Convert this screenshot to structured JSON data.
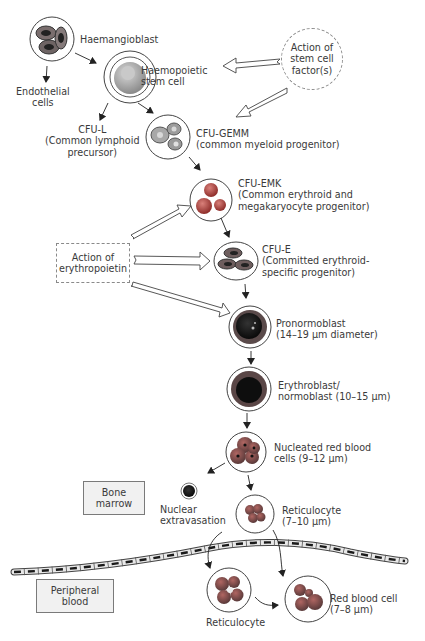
{
  "diagram": {
    "nodes": {
      "haemangioblast": {
        "label": "Haemangioblast"
      },
      "endothelial": {
        "label": "Endothelial\ncells"
      },
      "hsc": {
        "label": "Haemopoietic\nstem cell"
      },
      "cfu_l": {
        "label": "CFU-L\n(Common lymphoid\nprecursor)"
      },
      "cfu_gemm": {
        "label": "CFU-GEMM\n(common myeloid progenitor)"
      },
      "cfu_emk": {
        "label": "CFU-EMK\n(Common erythroid and\nmegakaryocyte progenitor)"
      },
      "cfu_e": {
        "label": "CFU-E\n(Committed erythroid-\nspecific progenitor)"
      },
      "pronormoblast": {
        "label": "Pronormoblast\n(14–19 μm diameter)"
      },
      "erythroblast": {
        "label": "Erythroblast/\nnormoblast (10–15 μm)"
      },
      "nucleated_rbc": {
        "label": "Nucleated red blood\ncells (9–12 μm)"
      },
      "nuclear_extravasation": {
        "label": "Nuclear\nextravasation"
      },
      "reticulocyte_marrow": {
        "label": "Reticulocyte\n(7–10 μm)"
      },
      "reticulocyte_blood": {
        "label": "Reticulocyte"
      },
      "rbc": {
        "label": "Red blood cell\n(7–8 μm)"
      }
    },
    "factors": {
      "stem_cell_factor": {
        "label": "Action of\nstem cell\nfactor(s)"
      },
      "erythropoietin": {
        "label": "Action of\nerythropoietin"
      }
    },
    "regions": {
      "bone_marrow": {
        "label": "Bone\nmarrow"
      },
      "peripheral_blood": {
        "label": "Peripheral\nblood"
      }
    },
    "colors": {
      "outline": "#3a3a3a",
      "cell_grey": "#8c8c8c",
      "cell_red": "#b0413e",
      "cell_dark": "#1e1e1e",
      "box_fill": "#f1f1f1"
    }
  }
}
